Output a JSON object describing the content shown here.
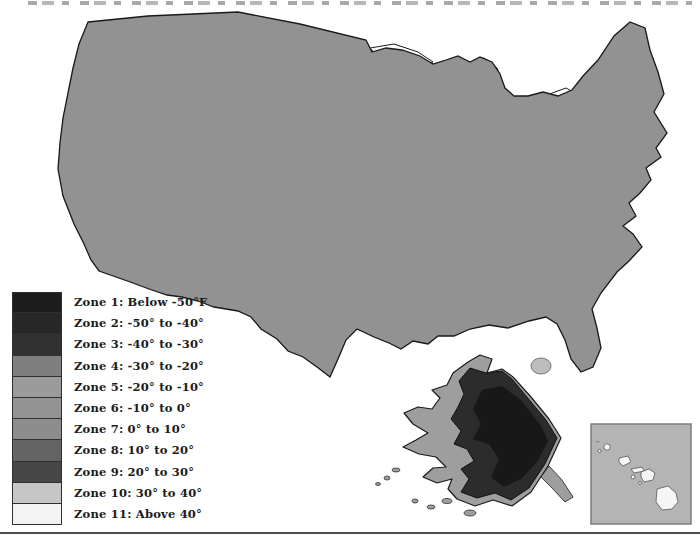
{
  "page": {
    "background": "#ffffff"
  },
  "legend": {
    "items": [
      {
        "label": "Zone 1: Below -50°F",
        "color": "#1d1d1d"
      },
      {
        "label": "Zone 2: -50° to -40°",
        "color": "#272727"
      },
      {
        "label": "Zone 3: -40° to -30°",
        "color": "#323232"
      },
      {
        "label": "Zone 4: -30° to -20°",
        "color": "#7f7f7f"
      },
      {
        "label": "Zone 5: -20° to -10°",
        "color": "#9b9b9b"
      },
      {
        "label": "Zone 6: -10° to 0°",
        "color": "#939393"
      },
      {
        "label": "Zone 7: 0° to 10°",
        "color": "#8d8d8d"
      },
      {
        "label": "Zone 8: 10° to 20°",
        "color": "#646464"
      },
      {
        "label": "Zone 9: 20° to 30°",
        "color": "#474747"
      },
      {
        "label": "Zone 10: 30° to 40°",
        "color": "#c6c6c6"
      },
      {
        "label": "Zone 11: Above 40°",
        "color": "#f3f3f3"
      }
    ]
  },
  "map": {
    "palette": {
      "base_mid": "#929292",
      "light_mid": "#a6a6a6",
      "north_band": "#686868",
      "north_core": "#343434",
      "upland_dark": "#4e4e4e",
      "south_band": "#636363",
      "coastal_dark": "#454545",
      "florida_tip": "#c8c8c8",
      "zone11_dot": "#f3f3f3",
      "lake": "#ffffff",
      "state_line": "#ffffff",
      "contour": "#242424",
      "alaska_base": "#9e9e9e",
      "alaska_dark": "#2c2c2c",
      "alaska_core": "#181818",
      "canada_blob": "#bdbdbd",
      "hawaii_sea": "#b4b4b4",
      "hawaii_island": "#f5f5f5"
    }
  },
  "divider": {
    "color": "#4f4f4f"
  }
}
